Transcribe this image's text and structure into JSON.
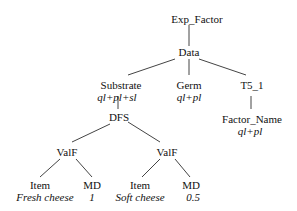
{
  "tree": {
    "nodes": [
      {
        "id": "exp_factor",
        "label": "Exp_Factor",
        "annotation": null,
        "x": 198,
        "y": 14
      },
      {
        "id": "data",
        "label": "Data",
        "annotation": null,
        "x": 198,
        "y": 47
      },
      {
        "id": "substrate",
        "label": "Substrate",
        "annotation": "ql+pl+sl",
        "x": 122,
        "y": 80
      },
      {
        "id": "germ",
        "label": "Germ",
        "annotation": "ql+pl",
        "x": 198,
        "y": 80
      },
      {
        "id": "t5_1",
        "label": "T5_1",
        "annotation": null,
        "x": 253,
        "y": 80
      },
      {
        "id": "dfs",
        "label": "DFS",
        "annotation": null,
        "x": 118,
        "y": 114
      },
      {
        "id": "factor_name",
        "label": "Factor_Name",
        "annotation": "ql+pl",
        "x": 252,
        "y": 114
      },
      {
        "id": "valf1",
        "label": "ValF",
        "annotation": null,
        "x": 64,
        "y": 148
      },
      {
        "id": "valf2",
        "label": "ValF",
        "annotation": null,
        "x": 167,
        "y": 148
      },
      {
        "id": "item1",
        "label": "Item",
        "annotation": "Fresh cheese",
        "x": 39,
        "y": 181
      },
      {
        "id": "md1",
        "label": "MD",
        "annotation": "1",
        "x": 93,
        "y": 181
      },
      {
        "id": "item2",
        "label": "Item",
        "annotation": "Soft cheese",
        "x": 139,
        "y": 181
      },
      {
        "id": "md2",
        "label": "MD",
        "annotation": "0.5",
        "x": 190,
        "y": 181
      }
    ]
  }
}
